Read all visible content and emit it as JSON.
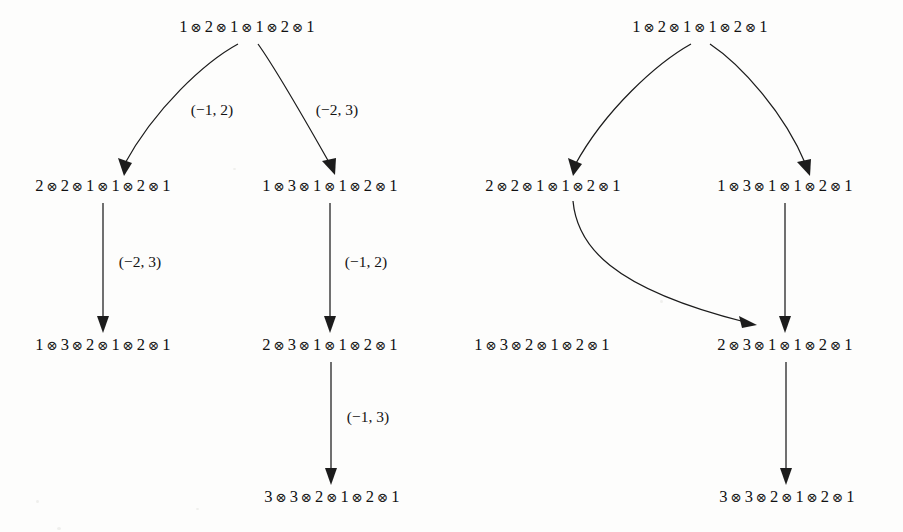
{
  "figure": {
    "background_color": "#fdfdfc",
    "ink_color": "#1c1c1c",
    "tensor_symbol": "⊗",
    "diagrams": [
      {
        "name": "left-diagram",
        "nodes": [
          {
            "id": "L0",
            "terms": [
              "1",
              "2",
              "1",
              "1",
              "2",
              "1"
            ],
            "x": 247,
            "y": 27
          },
          {
            "id": "L1",
            "terms": [
              "2",
              "2",
              "1",
              "1",
              "2",
              "1"
            ],
            "x": 103,
            "y": 186
          },
          {
            "id": "L2",
            "terms": [
              "1",
              "3",
              "1",
              "1",
              "2",
              "1"
            ],
            "x": 330,
            "y": 186
          },
          {
            "id": "L3",
            "terms": [
              "1",
              "3",
              "2",
              "1",
              "2",
              "1"
            ],
            "x": 103,
            "y": 345
          },
          {
            "id": "L4",
            "terms": [
              "2",
              "3",
              "1",
              "1",
              "2",
              "1"
            ],
            "x": 330,
            "y": 345
          },
          {
            "id": "L5",
            "terms": [
              "3",
              "3",
              "2",
              "1",
              "2",
              "1"
            ],
            "x": 332,
            "y": 497
          }
        ],
        "edge_labels": [
          {
            "id": "LE0",
            "text": "(−1, 2)",
            "x": 212,
            "y": 110
          },
          {
            "id": "LE1",
            "text": "(−2, 3)",
            "x": 337,
            "y": 110
          },
          {
            "id": "LE2",
            "text": "(−2, 3)",
            "x": 140,
            "y": 262
          },
          {
            "id": "LE3",
            "text": "(−1, 2)",
            "x": 366,
            "y": 262
          },
          {
            "id": "LE4",
            "text": "(−1, 3)",
            "x": 368,
            "y": 417
          }
        ]
      },
      {
        "name": "right-diagram",
        "nodes": [
          {
            "id": "R0",
            "terms": [
              "1",
              "2",
              "1",
              "1",
              "2",
              "1"
            ],
            "x": 700,
            "y": 27
          },
          {
            "id": "R1",
            "terms": [
              "2",
              "2",
              "1",
              "1",
              "2",
              "1"
            ],
            "x": 553,
            "y": 186
          },
          {
            "id": "R2",
            "terms": [
              "1",
              "3",
              "1",
              "1",
              "2",
              "1"
            ],
            "x": 785,
            "y": 186
          },
          {
            "id": "R3",
            "terms": [
              "1",
              "3",
              "2",
              "1",
              "2",
              "1"
            ],
            "x": 542,
            "y": 345
          },
          {
            "id": "R4",
            "terms": [
              "2",
              "3",
              "1",
              "1",
              "2",
              "1"
            ],
            "x": 785,
            "y": 345
          },
          {
            "id": "R5",
            "terms": [
              "3",
              "3",
              "2",
              "1",
              "2",
              "1"
            ],
            "x": 787,
            "y": 497
          }
        ],
        "edge_labels": []
      }
    ]
  }
}
